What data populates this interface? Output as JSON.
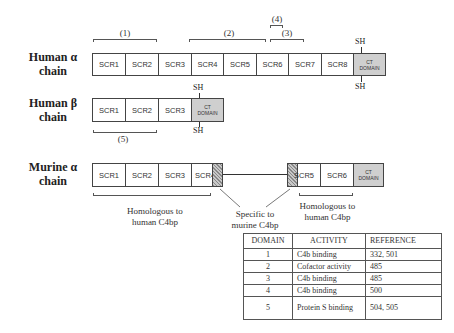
{
  "chains": {
    "human_alpha": {
      "label_line1": "Human α",
      "label_line2": "chain",
      "domains": [
        "SCR1",
        "SCR2",
        "SCR3",
        "SCR4",
        "SCR5",
        "SCR6",
        "SCR7",
        "SCR8"
      ],
      "ct_line1": "CT",
      "ct_line2": "DOMAIN",
      "sh_top": "SH",
      "sh_bottom": "SH"
    },
    "human_beta": {
      "label_line1": "Human β",
      "label_line2": "chain",
      "domains": [
        "SCR1",
        "SCR2",
        "SCR3"
      ],
      "ct_line1": "CT",
      "ct_line2": "DOMAIN",
      "sh_top": "SH",
      "sh_bottom": "SH"
    },
    "murine_alpha": {
      "label_line1": "Murine α",
      "label_line2": "chain",
      "domains": [
        "SCR1",
        "SCR2",
        "SCR3",
        "SCR4",
        "SCR5",
        "SCR6"
      ],
      "ct_line1": "CT",
      "ct_line2": "DOMAIN"
    }
  },
  "brackets": [
    "(1)",
    "(2)",
    "(3)",
    "(4)",
    "(5)"
  ],
  "annotations": {
    "homologous_left_1": "Homologous to",
    "homologous_left_2": "human C4bp",
    "specific_1": "Specific to",
    "specific_2": "murine C4bp",
    "homologous_right_1": "Homologous to",
    "homologous_right_2": "human C4bp"
  },
  "table": {
    "headers": [
      "DOMAIN",
      "ACTIVITY",
      "REFERENCE"
    ],
    "rows": [
      {
        "domain": "1",
        "activity": "C4b binding",
        "reference": "332, 501"
      },
      {
        "domain": "2",
        "activity": "Cofactor activity",
        "reference": "485"
      },
      {
        "domain": "3",
        "activity": "C4b binding",
        "reference": "485"
      },
      {
        "domain": "4",
        "activity": "C4b binding",
        "reference": "500"
      },
      {
        "domain": "5",
        "activity": "Protein S binding",
        "reference": "504, 505"
      }
    ]
  }
}
